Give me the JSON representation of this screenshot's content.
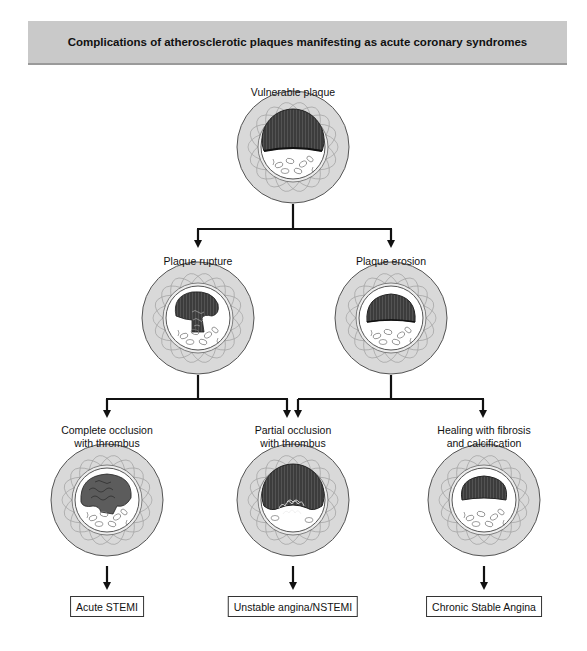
{
  "header": {
    "title": "Complications of atherosclerotic plaques manifesting as acute coronary syndromes"
  },
  "nodes": {
    "vulnerable": {
      "label": "Vulnerable plaque"
    },
    "rupture": {
      "label": "Plaque rupture"
    },
    "erosion": {
      "label": "Plaque erosion"
    },
    "complete_occlusion": {
      "line1": "Complete occlusion",
      "line2": "with thrombus"
    },
    "partial_occlusion": {
      "line1": "Partial occlusion",
      "line2": "with thrombus"
    },
    "healing": {
      "line1": "Healing with fibrosis",
      "line2": "and calcification"
    }
  },
  "outcomes": {
    "stemi": "Acute STEMI",
    "nstemi": "Unstable angina/NSTEMI",
    "stable": "Chronic Stable Angina"
  },
  "colors": {
    "header_band": "#c9c9c9",
    "vessel_wall": "#d6d6d6",
    "plaque_core": "#4a4a4a",
    "connector": "#111111"
  }
}
